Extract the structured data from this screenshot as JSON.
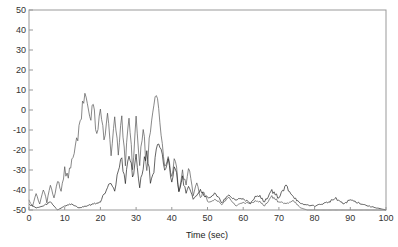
{
  "chart_data": {
    "type": "line",
    "title": "",
    "xlabel": "Time (sec)",
    "ylabel": "",
    "xlim": [
      0,
      100
    ],
    "ylim": [
      -50,
      50
    ],
    "xticks": [
      0,
      10,
      20,
      30,
      40,
      50,
      60,
      70,
      80,
      90,
      100
    ],
    "yticks": [
      50,
      40,
      30,
      20,
      10,
      0,
      -10,
      -20,
      -30,
      -40,
      -50
    ],
    "grid": false,
    "legend": null,
    "series": [
      {
        "name": "signal-1",
        "color": "#555555",
        "x": [
          0,
          1,
          2,
          3,
          4,
          5,
          6,
          7,
          8,
          9,
          10,
          11,
          12,
          13,
          14,
          15,
          16,
          17,
          18,
          19,
          20,
          21,
          22,
          23,
          24,
          25,
          26,
          27,
          28,
          29,
          30,
          31,
          32,
          33,
          34,
          35,
          36,
          37,
          38,
          39,
          40,
          41,
          42,
          43,
          44,
          45,
          46,
          47,
          48,
          49,
          50,
          52,
          54,
          56,
          58,
          60,
          62,
          64,
          66,
          68,
          70,
          72,
          74,
          76,
          78,
          80,
          85,
          90,
          95,
          100
        ],
        "y": [
          -45,
          -48,
          -42,
          -47,
          -40,
          -46,
          -38,
          -44,
          -35,
          -40,
          -30,
          -34,
          -25,
          -18,
          -10,
          2,
          9,
          -5,
          3,
          -12,
          1,
          -15,
          0,
          -20,
          -2,
          -22,
          -5,
          -25,
          -3,
          -28,
          -6,
          -26,
          -8,
          -30,
          -10,
          4,
          5,
          -15,
          -28,
          -25,
          -32,
          -24,
          -40,
          -30,
          -38,
          -28,
          -42,
          -35,
          -44,
          -40,
          -46,
          -45,
          -47,
          -44,
          -48,
          -46,
          -47,
          -45,
          -48,
          -43,
          -46,
          -47,
          -45,
          -49,
          -50,
          -50,
          -50,
          -50,
          -50,
          -50
        ]
      },
      {
        "name": "signal-2",
        "color": "#222222",
        "x": [
          0,
          2,
          4,
          6,
          8,
          10,
          12,
          14,
          16,
          18,
          20,
          21,
          22,
          23,
          24,
          25,
          26,
          27,
          28,
          29,
          30,
          31,
          32,
          33,
          34,
          35,
          36,
          37,
          38,
          39,
          40,
          41,
          42,
          43,
          44,
          45,
          46,
          48,
          50,
          52,
          54,
          56,
          58,
          60,
          62,
          64,
          66,
          68,
          70,
          72,
          74,
          76,
          80,
          84,
          86,
          88,
          90,
          95,
          100
        ],
        "y": [
          -47,
          -49,
          -48,
          -46,
          -50,
          -48,
          -47,
          -49,
          -48,
          -47,
          -46,
          -42,
          -38,
          -35,
          -40,
          -30,
          -26,
          -35,
          -22,
          -32,
          -25,
          -38,
          -28,
          -20,
          -36,
          -30,
          -18,
          -22,
          -30,
          -26,
          -35,
          -28,
          -40,
          -33,
          -42,
          -38,
          -44,
          -40,
          -44,
          -42,
          -46,
          -43,
          -45,
          -44,
          -47,
          -42,
          -46,
          -40,
          -44,
          -38,
          -43,
          -47,
          -48,
          -46,
          -44,
          -47,
          -45,
          -48,
          -50
        ]
      }
    ]
  }
}
